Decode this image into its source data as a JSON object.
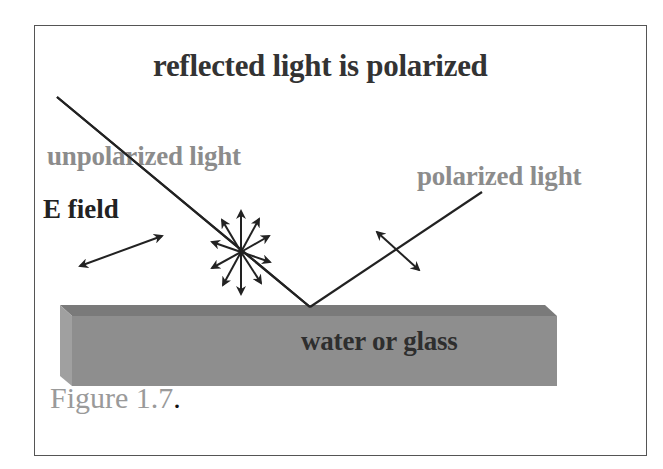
{
  "figure": {
    "title": "reflected light is polarized",
    "labels": {
      "incident": "unpolarized light",
      "reflected": "polarized light",
      "e_field": "E field",
      "surface": "water or glass"
    },
    "caption": {
      "text": "Figure 1.7",
      "terminator": "."
    }
  },
  "colors": {
    "title_text": "#333333",
    "gray_label": "#8c8c8c",
    "dark_label": "#222222",
    "surface_front": "#8e8e8e",
    "surface_top": "#7a7a7a",
    "surface_side": "#9e9e9e",
    "line": "#222222",
    "frame": "#555555"
  },
  "geometry": {
    "incident_ray": {
      "x1": 57,
      "y1": 97,
      "x2": 310,
      "y2": 307
    },
    "reflected_ray": {
      "x1": 310,
      "y1": 307,
      "x2": 482,
      "y2": 192
    },
    "e_field_arrow": {
      "x1": 80,
      "y1": 266,
      "x2": 162,
      "y2": 236
    },
    "polarized_arrow": {
      "x1": 377,
      "y1": 232,
      "x2": 419,
      "y2": 270
    },
    "star_center": {
      "x": 241,
      "y": 252
    }
  }
}
